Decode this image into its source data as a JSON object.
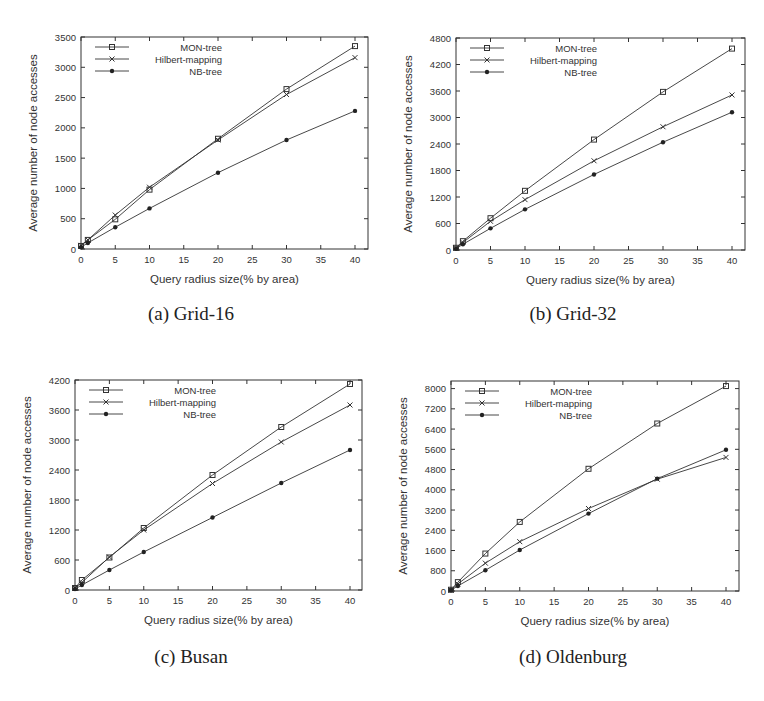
{
  "figure": {
    "panels": [
      {
        "caption": "(a) Grid-16",
        "layout": {
          "left": 0,
          "top": 0,
          "plot": {
            "x0": 81,
            "x1": 368,
            "y0": 37,
            "y1": 249,
            "xAt40": 355
          }
        }
      },
      {
        "caption": "(b) Grid-32",
        "layout": {
          "left": 382,
          "top": 0,
          "plot": {
            "x0": 74,
            "x1": 363,
            "y0": 38,
            "y1": 250,
            "xAt40": 350
          }
        }
      },
      {
        "caption": "(c) Busan",
        "layout": {
          "left": 0,
          "top": 340,
          "plot": {
            "x0": 75,
            "x1": 362,
            "y0": 40,
            "y1": 250,
            "xAt40": 350
          }
        }
      },
      {
        "caption": "(d) Oldenburg",
        "layout": {
          "left": 382,
          "top": 340,
          "plot": {
            "x0": 69,
            "x1": 357,
            "y0": 41,
            "y1": 251,
            "xAt40": 344
          }
        }
      }
    ]
  },
  "chart_data": [
    {
      "type": "line",
      "title": "(a) Grid-16",
      "xlabel": "Query radius size(% by area)",
      "ylabel": "Average number of node accesses",
      "x": [
        0,
        1,
        5,
        10,
        20,
        30,
        40
      ],
      "xticks": [
        0,
        5,
        10,
        15,
        20,
        25,
        30,
        35,
        40
      ],
      "yticks": [
        0,
        500,
        1000,
        1500,
        2000,
        2500,
        3000,
        3500
      ],
      "xlim": [
        0,
        42
      ],
      "ylim": [
        0,
        3500
      ],
      "grid": false,
      "legend_position": "upper left",
      "series": [
        {
          "name": "MON-tree",
          "marker": "square",
          "values": [
            50,
            150,
            490,
            980,
            1820,
            2640,
            3350
          ]
        },
        {
          "name": "Hilbert-mapping",
          "marker": "x",
          "values": [
            60,
            150,
            560,
            1020,
            1800,
            2550,
            3160
          ]
        },
        {
          "name": "NB-tree",
          "marker": "dot",
          "values": [
            30,
            100,
            360,
            670,
            1260,
            1800,
            2280
          ]
        }
      ]
    },
    {
      "type": "line",
      "title": "(b) Grid-32",
      "xlabel": "Query radius size(% by area)",
      "ylabel": "Average number of node accesses",
      "x": [
        0,
        1,
        5,
        10,
        20,
        30,
        40
      ],
      "xticks": [
        0,
        5,
        10,
        15,
        20,
        25,
        30,
        35,
        40
      ],
      "yticks": [
        0,
        600,
        1200,
        1800,
        2400,
        3000,
        3600,
        4200,
        4800
      ],
      "xlim": [
        0,
        42
      ],
      "ylim": [
        0,
        4800
      ],
      "grid": false,
      "legend_position": "upper left",
      "series": [
        {
          "name": "MON-tree",
          "marker": "square",
          "values": [
            50,
            200,
            720,
            1340,
            2500,
            3580,
            4560
          ]
        },
        {
          "name": "Hilbert-mapping",
          "marker": "x",
          "values": [
            40,
            170,
            650,
            1140,
            2020,
            2790,
            3510
          ]
        },
        {
          "name": "NB-tree",
          "marker": "dot",
          "values": [
            30,
            130,
            490,
            920,
            1710,
            2440,
            3120
          ]
        }
      ]
    },
    {
      "type": "line",
      "title": "(c) Busan",
      "xlabel": "Query radius size(% by area)",
      "ylabel": "Average number of node accesses",
      "x": [
        0,
        1,
        5,
        10,
        20,
        30,
        40
      ],
      "xticks": [
        0,
        5,
        10,
        15,
        20,
        25,
        30,
        35,
        40
      ],
      "yticks": [
        0,
        600,
        1200,
        1800,
        2400,
        3000,
        3600,
        4200
      ],
      "xlim": [
        0,
        42
      ],
      "ylim": [
        0,
        4200
      ],
      "grid": false,
      "legend_position": "upper left",
      "series": [
        {
          "name": "MON-tree",
          "marker": "square",
          "values": [
            40,
            200,
            650,
            1240,
            2300,
            3260,
            4120
          ]
        },
        {
          "name": "Hilbert-mapping",
          "marker": "x",
          "values": [
            40,
            150,
            660,
            1200,
            2130,
            2960,
            3700
          ]
        },
        {
          "name": "NB-tree",
          "marker": "dot",
          "values": [
            20,
            100,
            400,
            760,
            1450,
            2140,
            2800
          ]
        }
      ]
    },
    {
      "type": "line",
      "title": "(d) Oldenburg",
      "xlabel": "Query radius size(% by area)",
      "ylabel": "Average number of node accesses",
      "x": [
        0,
        1,
        5,
        10,
        20,
        30,
        40
      ],
      "xticks": [
        0,
        5,
        10,
        15,
        20,
        25,
        30,
        35,
        40
      ],
      "yticks": [
        0,
        800,
        1600,
        2400,
        3200,
        4000,
        4800,
        5600,
        6400,
        7200,
        8000
      ],
      "xlim": [
        0,
        42
      ],
      "ylim": [
        0,
        8300
      ],
      "grid": false,
      "legend_position": "upper left",
      "series": [
        {
          "name": "MON-tree",
          "marker": "square",
          "values": [
            50,
            350,
            1480,
            2730,
            4830,
            6620,
            8100
          ]
        },
        {
          "name": "Hilbert-mapping",
          "marker": "x",
          "values": [
            40,
            280,
            1100,
            1950,
            3260,
            4420,
            5280
          ]
        },
        {
          "name": "NB-tree",
          "marker": "dot",
          "values": [
            30,
            200,
            820,
            1620,
            3060,
            4440,
            5580
          ]
        }
      ]
    }
  ]
}
